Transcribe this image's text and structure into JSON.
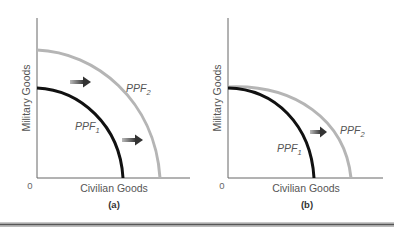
{
  "figure": {
    "panels": [
      {
        "id": "a",
        "label": "(a)",
        "y_axis_title": "Military Goods",
        "x_axis_title": "Civilian Goods",
        "origin_label": "0",
        "curves": [
          {
            "name": "PPF1",
            "base": "PPF",
            "subscript": "1",
            "color": "#111111"
          },
          {
            "name": "PPF2",
            "base": "PPF",
            "subscript": "2",
            "color": "#b0b0b0"
          }
        ],
        "shift_arrows": 2,
        "description": "Parallel outward shift of PPF"
      },
      {
        "id": "b",
        "label": "(b)",
        "y_axis_title": "Military Goods",
        "x_axis_title": "Civilian Goods",
        "origin_label": "0",
        "curves": [
          {
            "name": "PPF1",
            "base": "PPF",
            "subscript": "1",
            "color": "#111111"
          },
          {
            "name": "PPF2",
            "base": "PPF",
            "subscript": "2",
            "color": "#b0b0b0"
          }
        ],
        "shift_arrows": 1,
        "description": "Outward shift along civilian goods axis only"
      }
    ]
  }
}
